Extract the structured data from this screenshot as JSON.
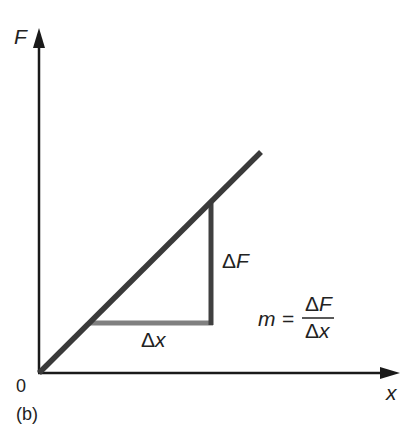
{
  "figure": {
    "panel_label": "(b)",
    "axes": {
      "y_label": "F",
      "x_label": "x",
      "origin_label": "0"
    },
    "line": {
      "description": "straight line through origin",
      "color": "#3a3a3a"
    },
    "triangle": {
      "horizontal_leg_label": "Δx",
      "vertical_leg_label": "ΔF",
      "horizontal_color": "#808080",
      "vertical_color": "#404040"
    },
    "equation": {
      "lhs": "m",
      "equals": "=",
      "numerator": "ΔF",
      "denominator": "Δx"
    }
  }
}
